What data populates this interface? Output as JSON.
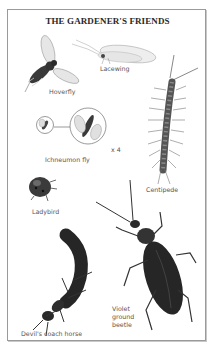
{
  "title": "THE GARDENER'S FRIENDS",
  "creatures": [
    {
      "name": "Hoverfly",
      "label": "Hoverfly"
    },
    {
      "name": "Lacewing",
      "label": "Lacewing"
    },
    {
      "name": "Ichneumon fly",
      "label": "Ichneumon fly",
      "magnification": "x 4"
    },
    {
      "name": "Centipede",
      "label": "Centipede"
    },
    {
      "name": "Ladybird",
      "label": "Ladybird"
    },
    {
      "name": "Violet ground beetle",
      "label": "Violet\nground\nbeetle"
    },
    {
      "name": "Devil's coach horse",
      "label": "Devil's coach horse"
    }
  ],
  "colors": {
    "border": "#9a9a9a",
    "text": "#555555",
    "title": "#2a2a2a",
    "insect_dark": "#2b2b2b",
    "wing": "#d8d8d8"
  }
}
